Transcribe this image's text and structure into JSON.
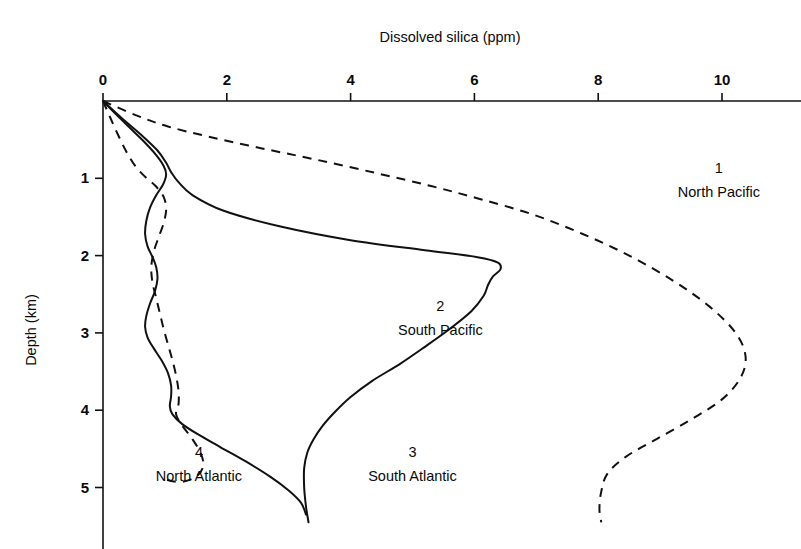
{
  "chart_data": {
    "type": "line",
    "title": "Dissolved silica (ppm)",
    "xlabel": "Dissolved silica (ppm)",
    "ylabel": "Depth (km)",
    "xlim": [
      0,
      11.3
    ],
    "ylim": [
      0,
      5.8
    ],
    "y_inverted": true,
    "grid": false,
    "legend_position": "inline-annotations",
    "x_ticks": [
      0,
      2,
      4,
      6,
      8,
      10
    ],
    "x_tick_labels": [
      "0",
      "2",
      "4",
      "6",
      "8",
      "10"
    ],
    "y_ticks": [
      1,
      2,
      3,
      4,
      5
    ],
    "y_tick_labels": [
      "1",
      "2",
      "3",
      "4",
      "5"
    ],
    "x_axis_position": "top",
    "series": [
      {
        "number": "1",
        "name": "North Pacific",
        "style": "dashed",
        "label_x": 9.95,
        "label_y": 0.93,
        "points": [
          [
            0.0,
            0.0
          ],
          [
            0.55,
            0.19
          ],
          [
            1.05,
            0.33
          ],
          [
            1.7,
            0.46
          ],
          [
            2.55,
            0.61
          ],
          [
            3.45,
            0.76
          ],
          [
            4.4,
            0.93
          ],
          [
            5.3,
            1.1
          ],
          [
            6.1,
            1.27
          ],
          [
            6.95,
            1.47
          ],
          [
            7.75,
            1.72
          ],
          [
            8.5,
            2.0
          ],
          [
            9.2,
            2.32
          ],
          [
            9.8,
            2.66
          ],
          [
            10.22,
            3.0
          ],
          [
            10.38,
            3.3
          ],
          [
            10.3,
            3.58
          ],
          [
            10.0,
            3.86
          ],
          [
            9.5,
            4.12
          ],
          [
            8.95,
            4.37
          ],
          [
            8.45,
            4.6
          ],
          [
            8.15,
            4.82
          ],
          [
            8.05,
            5.05
          ],
          [
            8.02,
            5.28
          ],
          [
            8.05,
            5.45
          ]
        ]
      },
      {
        "number": "2",
        "name": "South Pacific",
        "style": "solid",
        "label_x": 5.45,
        "label_y": 2.72,
        "points": [
          [
            0.0,
            0.0
          ],
          [
            0.3,
            0.22
          ],
          [
            0.62,
            0.44
          ],
          [
            0.88,
            0.64
          ],
          [
            1.02,
            0.8
          ],
          [
            1.1,
            0.92
          ],
          [
            1.22,
            1.05
          ],
          [
            1.45,
            1.22
          ],
          [
            1.95,
            1.42
          ],
          [
            2.85,
            1.62
          ],
          [
            4.0,
            1.8
          ],
          [
            5.2,
            1.93
          ],
          [
            6.05,
            2.02
          ],
          [
            6.38,
            2.09
          ],
          [
            6.42,
            2.18
          ],
          [
            6.3,
            2.27
          ],
          [
            6.22,
            2.38
          ],
          [
            6.15,
            2.52
          ],
          [
            5.95,
            2.72
          ],
          [
            5.6,
            2.95
          ],
          [
            5.2,
            3.18
          ],
          [
            4.8,
            3.4
          ],
          [
            4.35,
            3.62
          ],
          [
            4.0,
            3.83
          ],
          [
            3.75,
            4.02
          ],
          [
            3.55,
            4.2
          ],
          [
            3.4,
            4.38
          ],
          [
            3.3,
            4.55
          ],
          [
            3.25,
            4.75
          ],
          [
            3.25,
            5.0
          ],
          [
            3.28,
            5.25
          ],
          [
            3.32,
            5.45
          ]
        ]
      },
      {
        "number": "3",
        "name": "South Atlantic",
        "style": "solid",
        "label_x": 5.0,
        "label_y": 4.6,
        "points": [
          [
            0.0,
            0.0
          ],
          [
            0.22,
            0.18
          ],
          [
            0.45,
            0.36
          ],
          [
            0.68,
            0.54
          ],
          [
            0.86,
            0.7
          ],
          [
            0.98,
            0.84
          ],
          [
            1.02,
            0.95
          ],
          [
            0.97,
            1.08
          ],
          [
            0.86,
            1.22
          ],
          [
            0.76,
            1.38
          ],
          [
            0.7,
            1.55
          ],
          [
            0.68,
            1.72
          ],
          [
            0.72,
            1.88
          ],
          [
            0.8,
            2.02
          ],
          [
            0.86,
            2.15
          ],
          [
            0.88,
            2.3
          ],
          [
            0.84,
            2.46
          ],
          [
            0.76,
            2.62
          ],
          [
            0.7,
            2.78
          ],
          [
            0.68,
            2.92
          ],
          [
            0.72,
            3.06
          ],
          [
            0.82,
            3.2
          ],
          [
            0.95,
            3.36
          ],
          [
            1.05,
            3.52
          ],
          [
            1.1,
            3.68
          ],
          [
            1.1,
            3.82
          ],
          [
            1.08,
            3.95
          ],
          [
            1.12,
            4.05
          ],
          [
            1.28,
            4.18
          ],
          [
            1.55,
            4.32
          ],
          [
            1.9,
            4.48
          ],
          [
            2.3,
            4.66
          ],
          [
            2.7,
            4.86
          ],
          [
            3.0,
            5.04
          ],
          [
            3.2,
            5.2
          ],
          [
            3.28,
            5.35
          ]
        ]
      },
      {
        "number": "4",
        "name": "North Atlantic",
        "style": "dashed",
        "label_x": 1.55,
        "label_y": 4.6,
        "points": [
          [
            0.0,
            0.0
          ],
          [
            0.12,
            0.22
          ],
          [
            0.25,
            0.45
          ],
          [
            0.38,
            0.66
          ],
          [
            0.52,
            0.84
          ],
          [
            0.68,
            0.98
          ],
          [
            0.85,
            1.1
          ],
          [
            0.98,
            1.24
          ],
          [
            1.02,
            1.4
          ],
          [
            0.98,
            1.58
          ],
          [
            0.9,
            1.76
          ],
          [
            0.82,
            1.95
          ],
          [
            0.78,
            2.15
          ],
          [
            0.8,
            2.35
          ],
          [
            0.86,
            2.55
          ],
          [
            0.92,
            2.75
          ],
          [
            0.98,
            2.95
          ],
          [
            1.05,
            3.15
          ],
          [
            1.12,
            3.35
          ],
          [
            1.18,
            3.55
          ],
          [
            1.22,
            3.75
          ],
          [
            1.22,
            3.92
          ],
          [
            1.18,
            4.05
          ],
          [
            1.28,
            4.2
          ],
          [
            1.45,
            4.38
          ],
          [
            1.58,
            4.56
          ],
          [
            1.62,
            4.72
          ],
          [
            1.52,
            4.85
          ],
          [
            1.32,
            4.92
          ],
          [
            1.12,
            4.92
          ],
          [
            0.98,
            4.88
          ]
        ]
      }
    ]
  }
}
